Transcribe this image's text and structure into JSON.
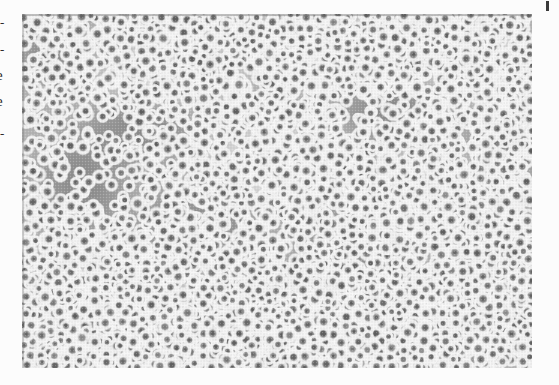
{
  "page": {
    "kind": "scanned-book-page",
    "background_color": "#fcfcfc",
    "width": 559,
    "height": 385
  },
  "margin_text": {
    "description": "cut-off text fragments at the left edge of the scanned page",
    "fragments": [
      {
        "glyph": "-",
        "top": 16,
        "kind": "dash"
      },
      {
        "glyph": "-",
        "top": 43,
        "kind": "dash"
      },
      {
        "glyph": "e",
        "top": 68,
        "kind": "letter"
      },
      {
        "glyph": "e",
        "top": 94,
        "kind": "letter"
      },
      {
        "glyph": "-",
        "top": 127,
        "kind": "dash"
      }
    ]
  },
  "scan_artifacts": {
    "top_right_tick": {
      "label": "scan-registration-tick",
      "color": "#3a3a3a"
    }
  },
  "micrograph": {
    "caption": "",
    "alt": "Phase-contrast light micrograph of a dense field of rounded cells appearing as bright rings with dark centers on a mottled gray background",
    "frame": {
      "left": 22,
      "top": 14,
      "width": 510,
      "height": 354
    },
    "background_color": "#9a9a9a",
    "cell_ring_color": "#f4f4f4",
    "cell_center_color": "#5d5d5d",
    "halftone": true
  }
}
